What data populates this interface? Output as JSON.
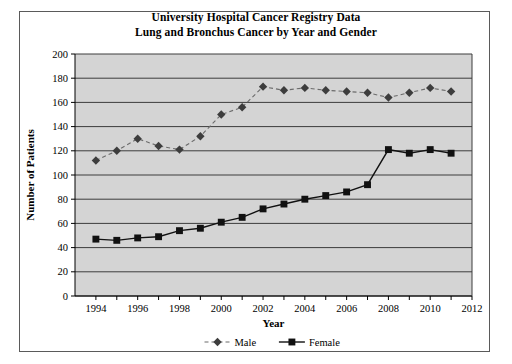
{
  "chart_data": {
    "type": "line",
    "title": "University Hospital Cancer Registry Data\nLung and Bronchus Cancer by Year and Gender",
    "title_line1": "University Hospital Cancer Registry Data",
    "title_line2": "Lung and Bronchus Cancer by Year and Gender",
    "xlabel": "Year",
    "ylabel": "Number of Patients",
    "x": [
      1994,
      1995,
      1996,
      1997,
      1998,
      1999,
      2000,
      2001,
      2002,
      2003,
      2004,
      2005,
      2006,
      2007,
      2008,
      2009,
      2010,
      2011
    ],
    "xlim": [
      1993,
      2012
    ],
    "ylim": [
      0,
      200
    ],
    "xticks": [
      1994,
      1995,
      1996,
      1997,
      1998,
      1999,
      2000,
      2001,
      2002,
      2003,
      2004,
      2005,
      2006,
      2007,
      2008,
      2009,
      2010,
      2011,
      2012
    ],
    "xtick_labels": [
      "1994",
      "",
      "1996",
      "",
      "1998",
      "",
      "2000",
      "",
      "2002",
      "",
      "2004",
      "",
      "2006",
      "",
      "2008",
      "",
      "2010",
      "",
      "2012"
    ],
    "yticks": [
      0,
      20,
      40,
      60,
      80,
      100,
      120,
      140,
      160,
      180,
      200
    ],
    "ytick_labels": [
      "0",
      "20",
      "40",
      "60",
      "80",
      "100",
      "120",
      "140",
      "160",
      "180",
      "200"
    ],
    "grid": "horizontal",
    "legend_position": "bottom",
    "plot_background": "#d4d4d4",
    "series": [
      {
        "name": "Male",
        "color": "#6b6b6b",
        "marker": "diamond",
        "marker_color": "#3d3d3d",
        "line_style": "dashed",
        "values": [
          112,
          120,
          130,
          124,
          121,
          132,
          150,
          156,
          173,
          170,
          172,
          170,
          169,
          168,
          164,
          168,
          172,
          169
        ]
      },
      {
        "name": "Female",
        "color": "#111111",
        "marker": "square",
        "marker_color": "#111111",
        "line_style": "solid",
        "values": [
          47,
          46,
          48,
          49,
          54,
          56,
          61,
          65,
          72,
          76,
          80,
          83,
          86,
          92,
          121,
          118,
          121,
          118
        ]
      }
    ]
  },
  "legend": {
    "items": [
      {
        "label": "Male"
      },
      {
        "label": "Female"
      }
    ]
  }
}
